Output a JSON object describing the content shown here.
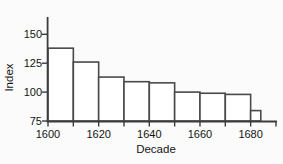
{
  "chart_data": {
    "type": "bar",
    "title": "",
    "xlabel": "Decade",
    "ylabel": "Index",
    "x_tick_labels": [
      "1600",
      "1620",
      "1640",
      "1660",
      "1680"
    ],
    "x_tick_values": [
      1600,
      1620,
      1640,
      1660,
      1680
    ],
    "x_minor_tick_values": [
      1600,
      1610,
      1620,
      1630,
      1640,
      1650,
      1660,
      1670,
      1680,
      1690
    ],
    "y_tick_labels": [
      "75",
      "100",
      "125",
      "150"
    ],
    "y_tick_values": [
      75,
      100,
      125,
      150
    ],
    "xlim": [
      1600,
      1690
    ],
    "ylim": [
      75,
      165
    ],
    "grid": false,
    "legend": null,
    "bars": [
      {
        "x_start": 1600,
        "x_end": 1610,
        "value": 138
      },
      {
        "x_start": 1610,
        "x_end": 1620,
        "value": 126
      },
      {
        "x_start": 1620,
        "x_end": 1630,
        "value": 113
      },
      {
        "x_start": 1630,
        "x_end": 1640,
        "value": 109
      },
      {
        "x_start": 1640,
        "x_end": 1650,
        "value": 108
      },
      {
        "x_start": 1650,
        "x_end": 1660,
        "value": 100
      },
      {
        "x_start": 1660,
        "x_end": 1670,
        "value": 99
      },
      {
        "x_start": 1670,
        "x_end": 1680,
        "value": 98
      },
      {
        "x_start": 1680,
        "x_end": 1684,
        "value": 84
      }
    ],
    "colors": {
      "bar_fill": "#ffffff",
      "bar_border": "#4a4a4a",
      "axis": "#3c3c3c",
      "tick": "#3c3c3c",
      "text": "#141414",
      "background": "#fbfbfb"
    }
  }
}
